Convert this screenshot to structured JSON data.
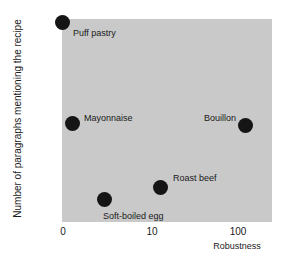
{
  "chart_data": {
    "type": "scatter",
    "title": "",
    "xlabel": "Robustness",
    "ylabel": "Number of paragraphs mentioning the recipe",
    "xscale": "log-like",
    "xticks": [
      "0",
      "10",
      "100"
    ],
    "yticks": [
      "0",
      "50",
      "100",
      "150",
      "200"
    ],
    "ylim": [
      0,
      210
    ],
    "grid": false,
    "legend": "none",
    "plot_background": "#c9c9c9",
    "marker_color": "#151515",
    "points": [
      {
        "label": "Puff pastry",
        "x": 0,
        "y": 200
      },
      {
        "label": "Mayonnaise",
        "x": 1.5,
        "y": 104
      },
      {
        "label": "Soft-boiled egg",
        "x": 4.5,
        "y": 27
      },
      {
        "label": "Roast beef",
        "x": 12,
        "y": 40
      },
      {
        "label": "Bouillon",
        "x": 105,
        "y": 102
      }
    ]
  },
  "axes": {
    "y_title": "Number of paragraphs mentioning the recipe",
    "x_title": "Robustness",
    "y_ticks": [
      {
        "value": "200",
        "top": 18
      },
      {
        "value": "150",
        "top": 68
      },
      {
        "value": "100",
        "top": 118
      },
      {
        "value": "50",
        "top": 168
      },
      {
        "value": "0",
        "top": 217
      }
    ],
    "x_ticks": [
      {
        "value": "0",
        "left": 63
      },
      {
        "value": "10",
        "left": 152
      },
      {
        "value": "100",
        "left": 238
      }
    ]
  },
  "markers": [
    {
      "name": "puff-pastry",
      "left": 62,
      "top": 22,
      "label": "Puff pastry",
      "label_left": 73,
      "label_top": 28
    },
    {
      "name": "mayonnaise",
      "left": 72,
      "top": 123,
      "label": "Mayonnaise",
      "label_left": 84,
      "label_top": 113
    },
    {
      "name": "soft-boiled-egg",
      "left": 104,
      "top": 199,
      "label": "Soft-boiled egg",
      "label_left": 103,
      "label_top": 211
    },
    {
      "name": "roast-beef",
      "left": 160,
      "top": 187,
      "label": "Roast beef",
      "label_left": 173,
      "label_top": 173
    },
    {
      "name": "bouillon",
      "left": 245,
      "top": 125,
      "label": "Bouillon",
      "label_left": 204,
      "label_top": 113
    }
  ]
}
